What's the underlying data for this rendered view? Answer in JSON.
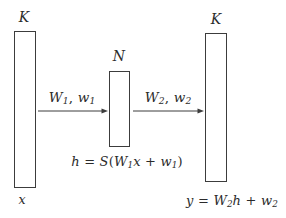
{
  "diagram": {
    "background_color": "#ffffff",
    "stroke_color": "#3c3c3c",
    "text_color": "#2b2b2b",
    "width": 286,
    "height": 218
  },
  "blocks": {
    "input": {
      "dimension_label": "K",
      "variable_label": "x",
      "name": "input-vector-block"
    },
    "hidden": {
      "dimension_label": "N",
      "name": "hidden-vector-block"
    },
    "output": {
      "dimension_label": "K",
      "name": "output-vector-block"
    }
  },
  "arrows": {
    "first": {
      "label_main": "W",
      "label_main_sub": "1",
      "label_comma": ", ",
      "label_second": "w",
      "label_second_sub": "1",
      "name": "first-layer-arrow"
    },
    "second": {
      "label_main": "W",
      "label_main_sub": "2",
      "label_comma": ", ",
      "label_second": "w",
      "label_second_sub": "2",
      "name": "second-layer-arrow"
    }
  },
  "equations": {
    "hidden": {
      "lhs": "h",
      "eq": " = ",
      "fn": "S",
      "open": "(",
      "w": "W",
      "w_sub": "1",
      "x": "x",
      "plus": " + ",
      "b": "w",
      "b_sub": "1",
      "close": ")"
    },
    "output": {
      "lhs": "y",
      "eq": " = ",
      "w": "W",
      "w_sub": "2",
      "h": "h",
      "plus": " + ",
      "b": "w",
      "b_sub": "2"
    }
  }
}
